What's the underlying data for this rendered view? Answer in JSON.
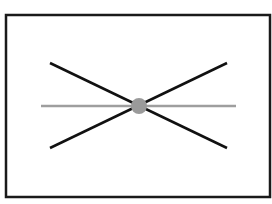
{
  "diagram": {
    "frame": {
      "x": 6,
      "y": 15,
      "width": 264,
      "height": 182,
      "stroke": "#1a1a1a",
      "stroke_width": 2.5
    },
    "lines": [
      {
        "name": "diagonal-line-descending",
        "x1": 50,
        "y1": 63,
        "x2": 227,
        "y2": 148,
        "stroke": "#111111",
        "stroke_width": 2.5
      },
      {
        "name": "diagonal-line-ascending",
        "x1": 50,
        "y1": 148,
        "x2": 227,
        "y2": 63,
        "stroke": "#111111",
        "stroke_width": 2.5
      },
      {
        "name": "horizontal-axis-line",
        "x1": 41,
        "y1": 106,
        "x2": 236,
        "y2": 106,
        "stroke": "#9e9e9e",
        "stroke_width": 2.5
      }
    ],
    "center_point": {
      "cx": 139,
      "cy": 106,
      "r": 8,
      "fill": "#9a9a9a"
    }
  }
}
